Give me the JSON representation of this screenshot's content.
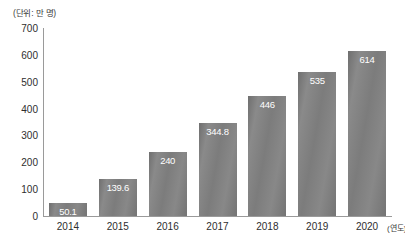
{
  "chart_data": {
    "type": "bar",
    "title": "",
    "unit_label": "(단위: 만 명)",
    "xlabel": "(연도)",
    "ylabel": "",
    "categories": [
      "2014",
      "2015",
      "2016",
      "2017",
      "2018",
      "2019",
      "2020"
    ],
    "values": [
      50.1,
      139.6,
      240,
      344.8,
      446,
      535,
      614
    ],
    "value_labels": [
      "50.1",
      "139.6",
      "240",
      "344.8",
      "446",
      "535",
      "614"
    ],
    "ylim": [
      0,
      700
    ],
    "yticks": [
      700,
      600,
      500,
      400,
      300,
      200,
      100,
      0
    ],
    "ytick_labels": [
      "700",
      "600",
      "500",
      "400",
      "300",
      "200",
      "100",
      "0"
    ],
    "grid": false,
    "legend": false,
    "bar_color": "#808080",
    "axis_color": "#9a9a9a",
    "value_label_color": "#ffffff",
    "background": "#ffffff"
  }
}
